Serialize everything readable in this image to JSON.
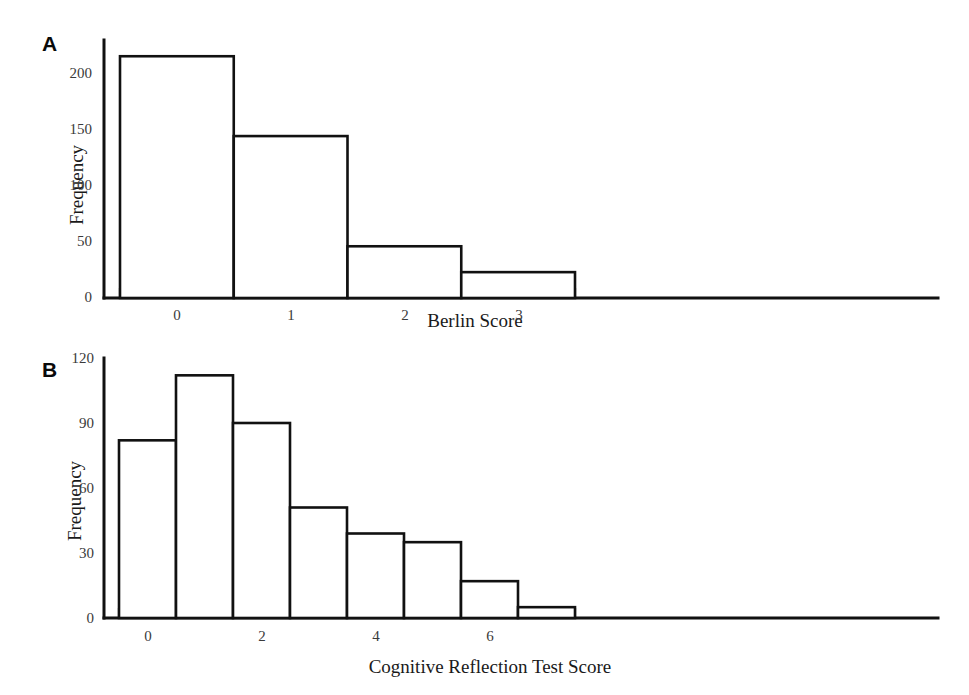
{
  "figure": {
    "panels": [
      {
        "id": "A",
        "letter": "A",
        "chart_index": 0
      },
      {
        "id": "B",
        "letter": "B",
        "chart_index": 1
      }
    ]
  },
  "chart_data": [
    {
      "type": "bar",
      "panel": "A",
      "title": "",
      "xlabel": "Berlin Score",
      "ylabel": "Frequency",
      "categories": [
        "0",
        "1",
        "2",
        "3"
      ],
      "values": [
        215,
        144,
        46,
        23
      ],
      "xtick_labels": [
        "0",
        "1",
        "2",
        "3"
      ],
      "xtick_values": [
        0,
        1,
        2,
        3
      ],
      "ytick_labels": [
        "0",
        "50",
        "100",
        "150",
        "200"
      ],
      "ytick_values": [
        0,
        50,
        100,
        150,
        200
      ],
      "xlim": [
        -0.5,
        3.5
      ],
      "ylim": [
        0,
        225
      ],
      "grid": false,
      "legend": false,
      "bar_style": "outline",
      "bar_edge_color": "#111111",
      "bar_fill_color": "#ffffff"
    },
    {
      "type": "bar",
      "panel": "B",
      "title": "",
      "xlabel": "Cognitive Reflection Test Score",
      "ylabel": "Frequency",
      "categories": [
        "0",
        "1",
        "2",
        "3",
        "4",
        "5",
        "6",
        "7"
      ],
      "values": [
        82,
        112,
        90,
        51,
        39,
        35,
        17,
        5
      ],
      "xtick_labels": [
        "0",
        "2",
        "4",
        "6"
      ],
      "xtick_values": [
        0,
        2,
        4,
        6
      ],
      "ytick_labels": [
        "0",
        "30",
        "60",
        "90",
        "120"
      ],
      "ytick_values": [
        0,
        30,
        60,
        90,
        120
      ],
      "xlim": [
        -0.5,
        7.5
      ],
      "ylim": [
        0,
        120
      ],
      "grid": false,
      "legend": false,
      "bar_style": "outline",
      "bar_edge_color": "#111111",
      "bar_fill_color": "#ffffff"
    }
  ],
  "colors": {
    "background": "#ffffff",
    "ink": "#111111",
    "tick_text": "#3a3a3a"
  }
}
